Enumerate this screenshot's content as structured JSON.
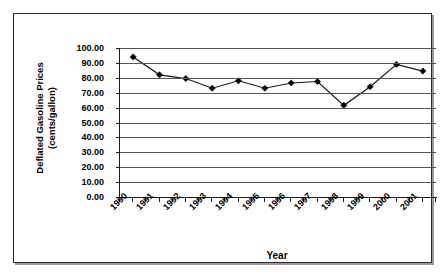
{
  "chart_data": {
    "type": "line",
    "title": "",
    "xlabel": "Year",
    "ylabel": "Deflated Gasoline Prices (cents/gallon)",
    "ylabel_lines": [
      "Deflated Gasoline Prices",
      "(cents/gallon)"
    ],
    "categories": [
      "1990",
      "1991",
      "1992",
      "1993",
      "1994",
      "1995",
      "1996",
      "1997",
      "1998",
      "1999",
      "2000",
      "2001"
    ],
    "values": [
      94.0,
      82.0,
      79.5,
      73.0,
      78.0,
      73.0,
      76.5,
      77.5,
      61.5,
      74.0,
      89.0,
      84.5
    ],
    "series": [
      {
        "name": "Deflated Gasoline Prices",
        "values": [
          94.0,
          82.0,
          79.5,
          73.0,
          78.0,
          73.0,
          76.5,
          77.5,
          61.5,
          74.0,
          89.0,
          84.5
        ]
      }
    ],
    "ylim": [
      0,
      100
    ],
    "ytick_values": [
      0,
      10,
      20,
      30,
      40,
      50,
      60,
      70,
      80,
      90,
      100
    ],
    "ytick_labels": [
      "0.00",
      "10.00",
      "20.00",
      "30.00",
      "40.00",
      "50.00",
      "60.00",
      "70.00",
      "80.00",
      "90.00",
      "100.00"
    ],
    "grid": "horizontal",
    "legend": "none",
    "marker": "diamond",
    "line_color": "#1a1a1a",
    "marker_color": "#000000",
    "grid_color": "#555555",
    "axis_color": "#1a1a1a",
    "plot_background": "#ffffff"
  }
}
